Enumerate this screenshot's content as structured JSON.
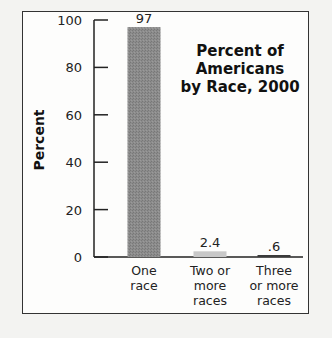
{
  "chart_data": {
    "type": "bar",
    "title": "Percent of Americans by Race, 2000",
    "title_lines": [
      "Percent of",
      "Americans",
      "by Race, 2000"
    ],
    "xlabel": "",
    "ylabel": "Percent",
    "ylim": [
      0,
      100
    ],
    "yticks": [
      0,
      20,
      40,
      60,
      80,
      100
    ],
    "categories": [
      "One race",
      "Two or more races",
      "Three or more races"
    ],
    "category_lines": [
      [
        "One",
        "race"
      ],
      [
        "Two or",
        "more",
        "races"
      ],
      [
        "Three",
        "or more",
        "races"
      ]
    ],
    "values": [
      97,
      2.4,
      0.6
    ],
    "value_labels": [
      "97",
      "2.4",
      ".6"
    ],
    "bar_colors": [
      "#8a8a8a",
      "#c8c8c8",
      "#3a3a3a"
    ],
    "grid": false,
    "legend": null
  }
}
